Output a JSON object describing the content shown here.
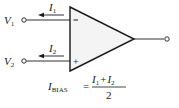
{
  "diagram": {
    "colors": {
      "stroke": "#1a1a1a",
      "fill": "#f4f4f4",
      "background": "#ffffff"
    },
    "inputs": [
      {
        "voltage_label": "V",
        "voltage_sub": "1",
        "current_label": "I",
        "current_sub": "1",
        "terminal_sign": "−"
      },
      {
        "voltage_label": "V",
        "voltage_sub": "2",
        "current_label": "I",
        "current_sub": "2",
        "terminal_sign": "+"
      }
    ],
    "formula": {
      "lhs": "I",
      "lhs_sub": "BIAS",
      "equals": "=",
      "numerator": {
        "a": "I",
        "a_sub": "1",
        "plus": "+",
        "b": "I",
        "b_sub": "2"
      },
      "denominator": "2"
    }
  }
}
